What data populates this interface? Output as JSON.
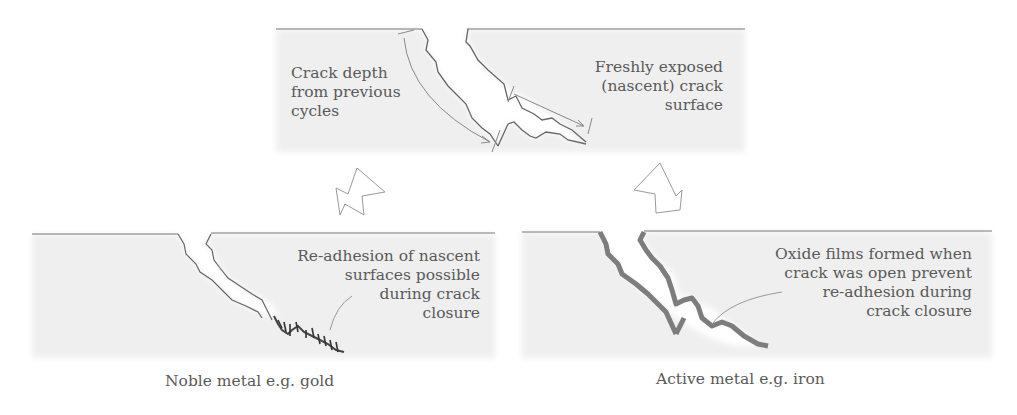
{
  "top_panel": {
    "left_label": [
      "Crack depth",
      "from previous",
      "cycles"
    ],
    "right_label": [
      "Freshly exposed",
      "(nascent) crack",
      "surface"
    ]
  },
  "left_panel": {
    "label": [
      "Re-adhesion of nascent",
      "surfaces possible",
      "during crack",
      "closure"
    ],
    "caption": "Noble metal e.g. gold"
  },
  "right_panel": {
    "label": [
      "Oxide films formed when",
      "crack was open prevent",
      "re-adhesion during",
      "crack closure"
    ],
    "caption": "Active metal e.g. iron"
  },
  "colors": {
    "panel_fill": "#eeeeee",
    "line": "#777777",
    "oxide": "#8a8a8a",
    "text": "#5a5a5a"
  }
}
